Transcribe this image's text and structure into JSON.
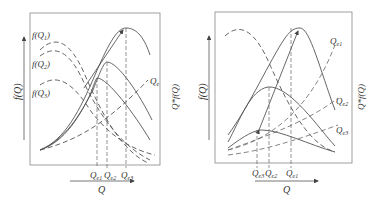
{
  "left_panel": {
    "y_axis_left_label": "f(Q)",
    "y_axis_right_label": "Q*f(Q)",
    "x_axis_label": "Q",
    "curve_labels": [
      {
        "base": "f(Q",
        "sub": "1",
        "tail": ")"
      },
      {
        "base": "f(Q",
        "sub": "2",
        "tail": ")"
      },
      {
        "base": "f(Q",
        "sub": "3",
        "tail": ")"
      }
    ],
    "line_label": {
      "base": "Q",
      "sub": "e"
    },
    "x_markers": [
      {
        "base": "Q",
        "sub": "e1"
      },
      {
        "base": "Q",
        "sub": "e2"
      },
      {
        "base": "Q",
        "sub": "e3"
      }
    ]
  },
  "right_panel": {
    "y_axis_left_label": "f(Q)",
    "y_axis_right_label": "Q*f(Q)",
    "x_axis_label": "Q",
    "line_labels": [
      {
        "base": "Q",
        "sub": "e1"
      },
      {
        "base": "Q",
        "sub": "e2"
      },
      {
        "base": "Q",
        "sub": "e3"
      }
    ],
    "x_markers": [
      {
        "base": "Q",
        "sub": "e3"
      },
      {
        "base": "Q",
        "sub": "e2"
      },
      {
        "base": "Q",
        "sub": "e1"
      }
    ]
  },
  "colors": {
    "line": "#555555",
    "frame": "#888888"
  }
}
